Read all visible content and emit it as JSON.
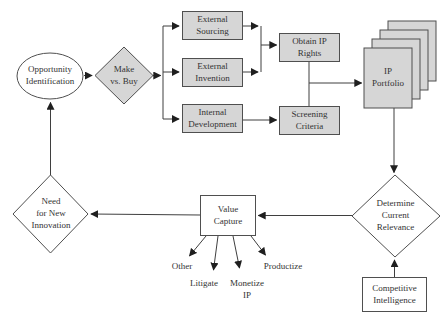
{
  "diagram": {
    "type": "flowchart",
    "colors": {
      "shaded_node_fill": "#d6d6d6",
      "white_node_fill": "#ffffff",
      "node_border": "#4f4f4f",
      "connector_line": "#3f3f3f",
      "arrowhead": "#1f1f1f",
      "text": "#333333",
      "background": "#ffffff"
    },
    "nodes": {
      "opportunity_identification": {
        "label": "Opportunity\nIdentification",
        "shape": "ellipse",
        "shaded": false
      },
      "make_vs_buy": {
        "label": "Make\nvs. Buy",
        "shape": "diamond",
        "shaded": true
      },
      "external_sourcing": {
        "label": "External\nSourcing",
        "shape": "rect",
        "shaded": true
      },
      "external_invention": {
        "label": "External\nInvention",
        "shape": "rect",
        "shaded": true
      },
      "internal_development": {
        "label": "Internal\nDevelopment",
        "shape": "rect",
        "shaded": true
      },
      "obtain_ip_rights": {
        "label": "Obtain IP\nRights",
        "shape": "rect",
        "shaded": true
      },
      "screening_criteria": {
        "label": "Screening\nCriteria",
        "shape": "rect",
        "shaded": true
      },
      "ip_portfolio": {
        "label": "IP\nPortfolio",
        "shape": "document-stack",
        "shaded": true
      },
      "determine_current_relevance": {
        "label": "Determine\nCurrent\nRelevance",
        "shape": "diamond",
        "shaded": false
      },
      "competitive_intelligence": {
        "label": "Competitive\nIntelligence",
        "shape": "rect",
        "shaded": false
      },
      "value_capture": {
        "label": "Value\nCapture",
        "shape": "rect",
        "shaded": false
      },
      "need_for_new_innovation": {
        "label": "Need\nfor New\nInnovation",
        "shape": "diamond",
        "shaded": false
      },
      "other": {
        "label": "Other",
        "shape": "label"
      },
      "litigate": {
        "label": "Litigate",
        "shape": "label"
      },
      "monetize_ip": {
        "label": "Monetize\nIP",
        "shape": "label"
      },
      "productize": {
        "label": "Productize",
        "shape": "label"
      }
    },
    "edges": [
      {
        "from": "Opportunity Identification",
        "to": "Make vs. Buy"
      },
      {
        "from": "Make vs. Buy",
        "to": "External Sourcing"
      },
      {
        "from": "Make vs. Buy",
        "to": "External Invention"
      },
      {
        "from": "Make vs. Buy",
        "to": "Internal Development"
      },
      {
        "from": "External Sourcing",
        "to": "Obtain IP Rights"
      },
      {
        "from": "External Invention",
        "to": "Obtain IP Rights"
      },
      {
        "from": "Internal Development",
        "to": "Screening Criteria"
      },
      {
        "from": "Obtain IP Rights",
        "to": "IP Portfolio"
      },
      {
        "from": "Screening Criteria",
        "to": "IP Portfolio"
      },
      {
        "from": "IP Portfolio",
        "to": "Determine Current Relevance"
      },
      {
        "from": "Competitive Intelligence",
        "to": "Determine Current Relevance"
      },
      {
        "from": "Determine Current Relevance",
        "to": "Value Capture"
      },
      {
        "from": "Value Capture",
        "to": "Need for New Innovation"
      },
      {
        "from": "Value Capture",
        "to": "Other"
      },
      {
        "from": "Value Capture",
        "to": "Litigate"
      },
      {
        "from": "Value Capture",
        "to": "Monetize IP"
      },
      {
        "from": "Value Capture",
        "to": "Productize"
      },
      {
        "from": "Need for New Innovation",
        "to": "Opportunity Identification"
      }
    ]
  }
}
